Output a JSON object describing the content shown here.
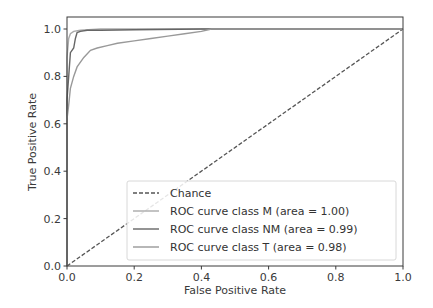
{
  "chart_data": {
    "type": "line",
    "title": "",
    "xlabel": "False Positive Rate",
    "ylabel": "True Positive Rate",
    "xlim": [
      0.0,
      1.0
    ],
    "ylim": [
      0.0,
      1.05
    ],
    "xticks": [
      "0.0",
      "0.2",
      "0.4",
      "0.6",
      "0.8",
      "1.0"
    ],
    "yticks": [
      "0.0",
      "0.2",
      "0.4",
      "0.6",
      "0.8",
      "1.0"
    ],
    "grid": false,
    "legend_position": "lower right",
    "series": [
      {
        "name": "Chance",
        "style": "dashed",
        "color": "#555555",
        "x": [
          0.0,
          1.0
        ],
        "y": [
          0.0,
          1.0
        ]
      },
      {
        "name": "ROC curve class M (area = 1.00)",
        "style": "solid",
        "color": "#aaaaaa",
        "x": [
          0.0,
          0.0,
          0.005,
          0.01,
          0.02,
          0.04,
          0.1,
          1.0
        ],
        "y": [
          0.0,
          0.88,
          0.96,
          0.98,
          0.99,
          0.995,
          1.0,
          1.0
        ]
      },
      {
        "name": "ROC curve class NM (area = 0.99)",
        "style": "solid",
        "color": "#666666",
        "x": [
          0.0,
          0.0,
          0.01,
          0.02,
          0.025,
          0.03,
          0.04,
          0.06,
          0.1,
          0.2,
          0.4,
          1.0
        ],
        "y": [
          0.0,
          0.7,
          0.9,
          0.92,
          0.96,
          0.985,
          0.99,
          0.995,
          0.995,
          0.997,
          1.0,
          1.0
        ]
      },
      {
        "name": "ROC curve class T (area = 0.98)",
        "style": "solid",
        "color": "#999999",
        "x": [
          0.0,
          0.0,
          0.005,
          0.01,
          0.02,
          0.03,
          0.05,
          0.07,
          0.09,
          0.12,
          0.15,
          0.2,
          0.25,
          0.3,
          0.35,
          0.4,
          0.43,
          0.5,
          1.0
        ],
        "y": [
          0.0,
          0.62,
          0.68,
          0.75,
          0.8,
          0.84,
          0.88,
          0.91,
          0.92,
          0.93,
          0.94,
          0.95,
          0.96,
          0.97,
          0.98,
          0.99,
          1.0,
          1.0,
          1.0
        ]
      }
    ]
  },
  "legend": {
    "items": [
      {
        "label": "Chance",
        "color": "#555555",
        "dashed": true
      },
      {
        "label": "ROC curve class M (area = 1.00)",
        "color": "#aaaaaa",
        "dashed": false
      },
      {
        "label": "ROC curve class NM (area = 0.99)",
        "color": "#666666",
        "dashed": false
      },
      {
        "label": "ROC curve class T (area = 0.98)",
        "color": "#999999",
        "dashed": false
      }
    ]
  },
  "axes": {
    "xlabel": "False Positive Rate",
    "ylabel": "True Positive Rate"
  }
}
